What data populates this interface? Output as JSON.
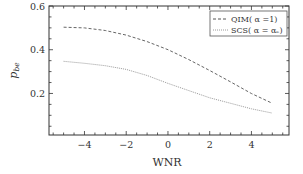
{
  "chart_data": {
    "type": "line",
    "title": "",
    "xlabel": "WNR",
    "ylabel": "p_be",
    "xlim": [
      -5.7,
      5.8
    ],
    "ylim": [
      0.01,
      0.6
    ],
    "xticks": [
      -4,
      -2,
      0,
      2,
      4
    ],
    "xtick_labels": [
      "−4",
      "−2",
      "0",
      "2",
      "4"
    ],
    "yticks": [
      0.2,
      0.4,
      0.6
    ],
    "ytick_labels": [
      "0.2",
      "0.4",
      "0.6"
    ],
    "grid": false,
    "legend_position": "upper right",
    "x": [
      -5,
      -4,
      -3,
      -2,
      -1,
      0,
      1,
      2,
      3,
      4,
      5
    ],
    "series": [
      {
        "name": "QIM( α =1)",
        "style": "dashed",
        "color": "#555555",
        "values": [
          0.503,
          0.5,
          0.488,
          0.467,
          0.437,
          0.4,
          0.355,
          0.305,
          0.253,
          0.2,
          0.155
        ]
      },
      {
        "name": "SCS( α = αₑ)",
        "style": "dotted",
        "color": "#9a9a9a",
        "values": [
          0.347,
          0.338,
          0.327,
          0.31,
          0.282,
          0.246,
          0.213,
          0.18,
          0.155,
          0.13,
          0.11
        ]
      }
    ]
  }
}
